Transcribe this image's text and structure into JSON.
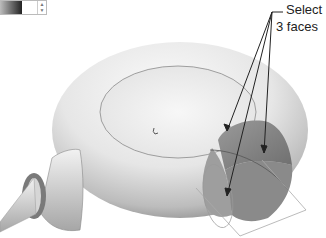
{
  "figure": {
    "callout": {
      "line1": "Select",
      "line2": "3 faces"
    },
    "colors": {
      "body_light": "#f4f4f4",
      "body_dark": "#9a9a9a",
      "selected_face": "#8a8a8a",
      "leader_line": "#222222",
      "nozzle_ring": "#6f6f6f"
    }
  },
  "toolbar_fragment": {
    "color_swatch": "gradient-swatch",
    "spinner": "spinner-arrows"
  }
}
